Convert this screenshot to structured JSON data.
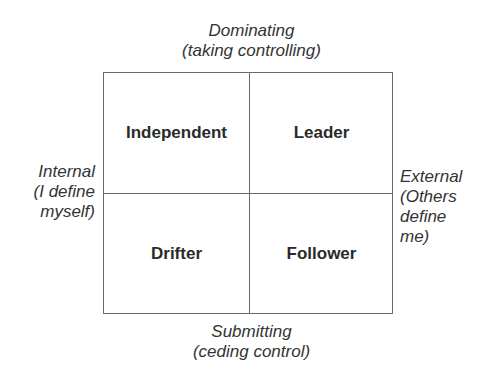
{
  "axes": {
    "top": {
      "line1": "Dominating",
      "line2": "(taking controlling)"
    },
    "bottom": {
      "line1": "Submitting",
      "line2": "(ceding control)"
    },
    "left": {
      "line1": "Internal",
      "line2": "(I define",
      "line3": "myself)"
    },
    "right": {
      "line1": "External",
      "line2": "(Others",
      "line3": "define",
      "line4": "me)"
    }
  },
  "quadrants": {
    "top_left": "Independent",
    "top_right": "Leader",
    "bottom_left": "Drifter",
    "bottom_right": "Follower"
  }
}
